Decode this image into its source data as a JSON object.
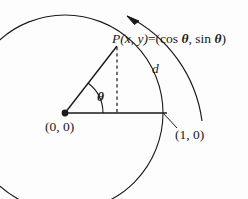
{
  "figure": {
    "background_color": "#fdfdfd",
    "stroke_color": "#1a1a1a"
  },
  "labels": {
    "point_p_prefix": "P(x, y)",
    "equals": "=",
    "point_p_coords_open": "(",
    "cos_text": "cos ",
    "theta_1": "θ",
    "comma": ", ",
    "sin_text": "sin ",
    "theta_2": "θ",
    "point_p_coords_close": ")",
    "origin": "(0, 0)",
    "unit_point": "(1, 0)",
    "theta_angle": "θ",
    "arc_length": "d"
  },
  "geometry": {
    "circle_center_x": 65,
    "circle_center_y": 113,
    "circle_radius": 98,
    "point_p_x": 117,
    "point_p_y": 45,
    "unit_point_x": 163,
    "unit_point_y": 113,
    "angle_degrees": 53,
    "outer_arc_radius": 138,
    "arrow_direction": "counterclockwise"
  }
}
